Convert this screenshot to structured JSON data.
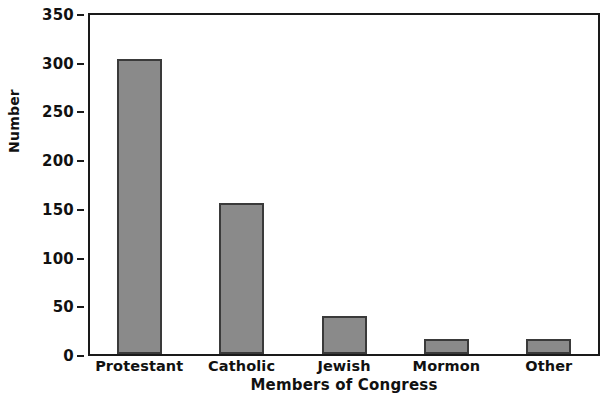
{
  "chart_data": {
    "type": "bar",
    "title": "",
    "categories": [
      "Protestant",
      "Catholic",
      "Jewish",
      "Mormon",
      "Other"
    ],
    "values": [
      303,
      155,
      39,
      15,
      15
    ],
    "xlabel": "Members of Congress",
    "ylabel": "Number",
    "ylim": [
      0,
      350
    ],
    "yticks": [
      0,
      50,
      100,
      150,
      200,
      250,
      300,
      350
    ],
    "ytick_labels": [
      "0",
      "50",
      "100",
      "150",
      "200",
      "250",
      "300",
      "350"
    ],
    "grid": false,
    "legend": false,
    "legend_position": "none",
    "bar_color": "#8a8a8a",
    "bar_edge_color": "#3a3a3a",
    "axis_color": "#1a1a1a",
    "background_color": "#ffffff"
  }
}
